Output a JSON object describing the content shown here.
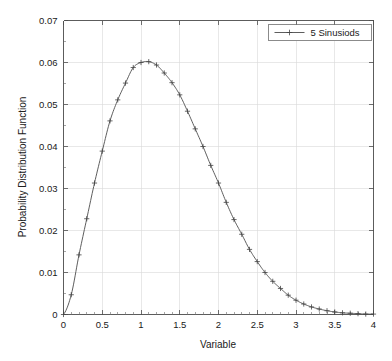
{
  "chart_data": {
    "type": "line",
    "title": "",
    "xlabel": "Variable",
    "ylabel": "Probability Distribution Function",
    "xlim": [
      0,
      4
    ],
    "ylim": [
      0,
      0.07
    ],
    "grid": true,
    "legend_position": "top-right",
    "xticks": [
      0,
      0.5,
      1,
      1.5,
      2,
      2.5,
      3,
      3.5,
      4
    ],
    "xtick_labels": [
      "0",
      "0.5",
      "1",
      "1.5",
      "2",
      "2.5",
      "3",
      "3.5",
      "4"
    ],
    "yticks": [
      0,
      0.01,
      0.02,
      0.03,
      0.04,
      0.05,
      0.06,
      0.07
    ],
    "ytick_labels": [
      "0",
      "0.01",
      "0.02",
      "0.03",
      "0.04",
      "0.05",
      "0.06",
      "0.07"
    ],
    "series": [
      {
        "name": "5 Sinusiods",
        "marker": "plus",
        "color": "#555555",
        "x": [
          0,
          0.1,
          0.2,
          0.3,
          0.4,
          0.5,
          0.6,
          0.7,
          0.8,
          0.9,
          1.0,
          1.1,
          1.2,
          1.3,
          1.4,
          1.5,
          1.6,
          1.7,
          1.8,
          1.9,
          2.0,
          2.1,
          2.2,
          2.3,
          2.4,
          2.5,
          2.6,
          2.7,
          2.8,
          2.9,
          3.0,
          3.1,
          3.2,
          3.3,
          3.4,
          3.5,
          3.6,
          3.7,
          3.8,
          3.9,
          4.0
        ],
        "y": [
          0.0,
          0.0047,
          0.0142,
          0.0228,
          0.0313,
          0.0389,
          0.0461,
          0.0511,
          0.0551,
          0.0588,
          0.06,
          0.0602,
          0.0594,
          0.0575,
          0.0552,
          0.0523,
          0.0484,
          0.0442,
          0.04,
          0.0355,
          0.0313,
          0.0267,
          0.0226,
          0.0191,
          0.0155,
          0.0126,
          0.01,
          0.0079,
          0.0062,
          0.0046,
          0.0034,
          0.0025,
          0.0018,
          0.0013,
          0.0009,
          0.0006,
          0.0004,
          0.0003,
          0.0002,
          0.0001,
          0.0001
        ]
      }
    ]
  },
  "legend": {
    "entries": [
      {
        "label": "5 Sinusiods"
      }
    ]
  },
  "axes": {
    "x_title": "Variable",
    "y_title": "Probability Distribution Function"
  }
}
